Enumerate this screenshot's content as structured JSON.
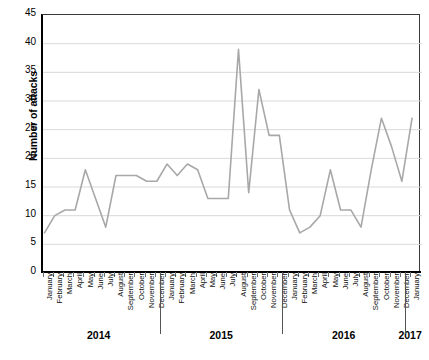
{
  "chart_data": {
    "type": "line",
    "title": "",
    "xlabel": "",
    "ylabel": "Number of attacks",
    "ylim": [
      0,
      45
    ],
    "ytick_step": 5,
    "yticks": [
      45,
      40,
      35,
      30,
      25,
      20,
      15,
      10,
      5,
      0
    ],
    "grid": true,
    "grid_axis": "y",
    "legend": "none",
    "line_color": "#a8a8a8",
    "axis_color": "#000000",
    "grid_color": "#d9d9d9",
    "categories": [
      "January",
      "February",
      "March",
      "April",
      "May",
      "June",
      "July",
      "August",
      "September",
      "October",
      "November",
      "December",
      "January",
      "February",
      "March",
      "April",
      "May",
      "June",
      "July",
      "August",
      "September",
      "October",
      "November",
      "December",
      "January",
      "February",
      "March",
      "April",
      "May",
      "June",
      "July",
      "August",
      "September",
      "October",
      "November",
      "December",
      "January"
    ],
    "values": [
      7,
      10,
      11,
      11,
      18,
      13,
      8,
      17,
      17,
      17,
      16,
      16,
      19,
      17,
      19,
      18,
      13,
      13,
      13,
      39,
      14,
      32,
      24,
      24,
      11,
      7,
      8,
      10,
      18,
      11,
      11,
      8,
      18,
      27,
      22,
      16,
      27
    ],
    "year_groups": [
      {
        "label": "2014",
        "start_index": 0,
        "end_index": 11
      },
      {
        "label": "2015",
        "start_index": 12,
        "end_index": 23
      },
      {
        "label": "2016",
        "start_index": 24,
        "end_index": 35
      },
      {
        "label": "2017",
        "start_index": 36,
        "end_index": 36
      }
    ]
  }
}
